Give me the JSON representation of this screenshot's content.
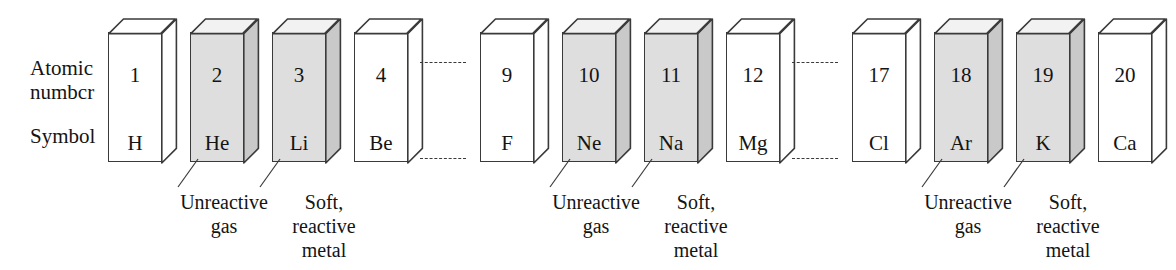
{
  "diagram": {
    "row_labels": {
      "atomic_number": "Atomic\nnumbcr",
      "symbol": "Symbol"
    },
    "colors": {
      "shaded_fill": "#dedede",
      "unshaded_fill": "#ffffff",
      "outline": "#3a3a3a",
      "side_face": "#c9c9c9",
      "top_face": "#f2f2f2",
      "text": "#141414"
    },
    "elements": [
      {
        "number": "1",
        "symbol": "H",
        "shaded": false,
        "x": 108
      },
      {
        "number": "2",
        "symbol": "He",
        "shaded": true,
        "x": 190
      },
      {
        "number": "3",
        "symbol": "Li",
        "shaded": true,
        "x": 272
      },
      {
        "number": "4",
        "symbol": "Be",
        "shaded": false,
        "x": 354
      },
      {
        "number": "9",
        "symbol": "F",
        "shaded": false,
        "x": 480
      },
      {
        "number": "10",
        "symbol": "Ne",
        "shaded": true,
        "x": 562
      },
      {
        "number": "11",
        "symbol": "Na",
        "shaded": true,
        "x": 644
      },
      {
        "number": "12",
        "symbol": "Mg",
        "shaded": false,
        "x": 726
      },
      {
        "number": "17",
        "symbol": "Cl",
        "shaded": false,
        "x": 852
      },
      {
        "number": "18",
        "symbol": "Ar",
        "shaded": true,
        "x": 934
      },
      {
        "number": "19",
        "symbol": "K",
        "shaded": true,
        "x": 1016
      },
      {
        "number": "20",
        "symbol": "Ca",
        "shaded": false,
        "x": 1098
      }
    ],
    "connectors": [
      {
        "x": 420,
        "y": 62
      },
      {
        "x": 792,
        "y": 62
      }
    ],
    "annotations": [
      {
        "text": "Unreactive\ngas",
        "caption_x": 159,
        "leader_x": 196,
        "leader_dir": "right"
      },
      {
        "text": "Soft,\nreactive\nmetal",
        "caption_x": 259,
        "leader_x": 278,
        "leader_dir": "right"
      },
      {
        "text": "Unreactive\ngas",
        "caption_x": 531,
        "leader_x": 568,
        "leader_dir": "right"
      },
      {
        "text": "Soft,\nreactive\nmetal",
        "caption_x": 631,
        "leader_x": 650,
        "leader_dir": "right"
      },
      {
        "text": "Unreactive\ngas",
        "caption_x": 903,
        "leader_x": 940,
        "leader_dir": "right"
      },
      {
        "text": "Soft,\nreactive\nmetal",
        "caption_x": 1003,
        "leader_x": 1022,
        "leader_dir": "right"
      }
    ],
    "caption_y": 190,
    "leader_y": 158
  }
}
